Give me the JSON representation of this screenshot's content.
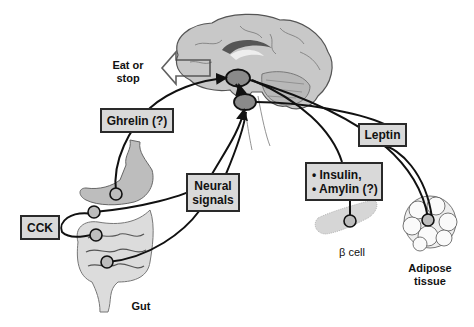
{
  "diagram": {
    "type": "physiology-signaling",
    "central_organ": "brain (hypothalamus)",
    "output_label": "Eat or\nstop",
    "signals": [
      {
        "id": "ghrelin",
        "label": "Ghrelin (?)",
        "source": "stomach"
      },
      {
        "id": "cck",
        "label": "CCK",
        "source": "gut"
      },
      {
        "id": "neural",
        "label": "Neural\nsignals",
        "source": "gut"
      },
      {
        "id": "insulin_amylin",
        "items": [
          "• Insulin,",
          "• Amylin (?)"
        ],
        "source": "β cell"
      },
      {
        "id": "leptin",
        "label": "Leptin",
        "source": "adipose tissue"
      }
    ],
    "sources": {
      "gut": "Gut",
      "beta_cell": "β cell",
      "adipose": "Adipose\ntissue"
    }
  },
  "labels": {
    "eat_or_stop_1": "Eat or",
    "eat_or_stop_2": "stop",
    "ghrelin": "Ghrelin (?)",
    "cck": "CCK",
    "neural_1": "Neural",
    "neural_2": "signals",
    "insulin": "• Insulin,",
    "amylin": "• Amylin (?)",
    "leptin": "Leptin",
    "gut": "Gut",
    "beta_cell": "β cell",
    "adipose_1": "Adipose",
    "adipose_2": "tissue"
  },
  "colors": {
    "box_fill": "#d9d9d9",
    "stroke": "#1a1a1a",
    "brain_fill": "#c8c8c8",
    "nucleus_fill": "#8a8a8a"
  }
}
